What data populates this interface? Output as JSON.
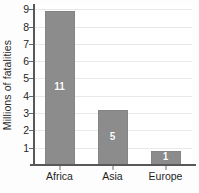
{
  "chart_data": {
    "type": "bar",
    "title": "",
    "subtitle": "",
    "xlabel": "",
    "ylabel": "Millions of fatalities",
    "categories": [
      "Africa",
      "Asia",
      "Europe"
    ],
    "values": [
      8.9,
      3.2,
      0.8
    ],
    "bar_labels": [
      "11",
      "5",
      "1"
    ],
    "ylim": [
      0,
      9.3
    ],
    "yticks": [
      1,
      2,
      3,
      4,
      5,
      6,
      7,
      8,
      9
    ],
    "ytick_labels": [
      "1",
      "2",
      "3",
      "4",
      "5",
      "6",
      "7",
      "8",
      "9"
    ],
    "grid": true,
    "legend": "none",
    "series": [
      {
        "name": "Millions of fatalities",
        "values": [
          8.9,
          3.2,
          0.8
        ],
        "labels": [
          "11",
          "5",
          "1"
        ]
      }
    ]
  },
  "colors": {
    "bar_fill": "#8c8c8c",
    "bar_edge": "#848484",
    "bar_label_text": "#ffffff",
    "gridline": "#e9e9e9",
    "axis_line": "#585858",
    "tick_text": "#1f1f1f",
    "axis_title_text": "#2b2b2b",
    "plot_background": "#ffffff",
    "figure_background": "#fdfdfd"
  }
}
